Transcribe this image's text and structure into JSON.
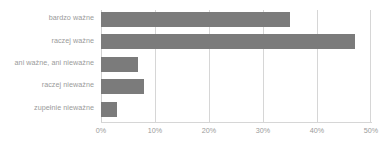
{
  "chart_data": {
    "type": "bar",
    "orientation": "horizontal",
    "title": "",
    "subtitle": "",
    "xlabel": "",
    "ylabel": "",
    "categories": [
      "bardzo ważne",
      "raczej ważne",
      "ani ważne, ani nieważne",
      "raczej nieważne",
      "zupełnie nieważne"
    ],
    "values": [
      35,
      47,
      6.8,
      8,
      3
    ],
    "value_suffix": "%",
    "xlim": [
      0,
      50
    ],
    "xticks": [
      0,
      10,
      20,
      30,
      40,
      50
    ],
    "xtick_labels": [
      "0%",
      "10%",
      "20%",
      "30%",
      "40%",
      "50%"
    ],
    "grid": true,
    "grid_axis": "x",
    "legend": false,
    "legend_position": "none",
    "colors": {
      "bar": "#7b7b7b",
      "gridline": "#d6d6d6",
      "label_text": "#9a9a9a",
      "tick_text": "#9a9a9a",
      "background": "#ffffff"
    }
  }
}
